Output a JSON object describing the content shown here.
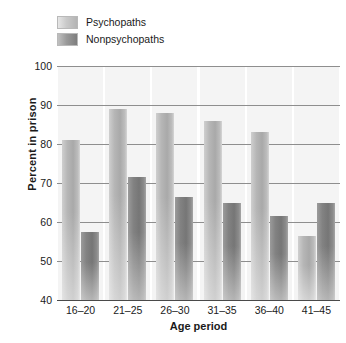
{
  "chart_data": {
    "type": "bar",
    "title": "",
    "xlabel": "Age period",
    "ylabel": "Percent in prison",
    "categories": [
      "16–20",
      "21–25",
      "26–30",
      "31–35",
      "36–40",
      "41–45"
    ],
    "series": [
      {
        "name": "Psychopaths",
        "values": [
          81,
          89,
          88,
          86,
          83,
          56.5
        ],
        "color": "#b0b0b0"
      },
      {
        "name": "Nonpsychopaths",
        "values": [
          57.5,
          71.5,
          66.5,
          65,
          61.5,
          65
        ],
        "color": "#7c7c7c"
      }
    ],
    "ylim": [
      40,
      100
    ],
    "yticks": [
      40,
      50,
      60,
      70,
      80,
      90,
      100
    ],
    "ytick_labels": [
      "40",
      "50",
      "60",
      "70",
      "80",
      "90",
      "100"
    ],
    "grid": true,
    "legend_position": "top-left"
  },
  "legend": {
    "items": [
      {
        "label": "Psychopaths",
        "swatch": "psy"
      },
      {
        "label": "Nonpsychopaths",
        "swatch": "nonpsy"
      }
    ]
  }
}
